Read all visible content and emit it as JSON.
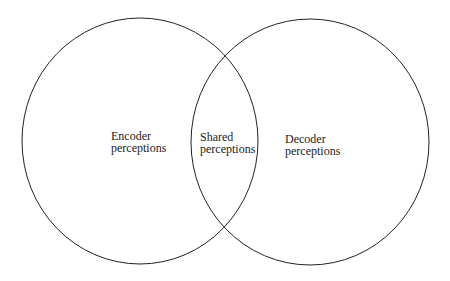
{
  "diagram": {
    "type": "venn",
    "sets": [
      {
        "id": "encoder",
        "line1": "Encoder",
        "line2": "perceptions"
      },
      {
        "id": "decoder",
        "line1": "Decoder",
        "line2": "perceptions"
      }
    ],
    "intersection": {
      "line1": "Shared",
      "line2": "perceptions"
    },
    "stroke_color": "#222222"
  }
}
